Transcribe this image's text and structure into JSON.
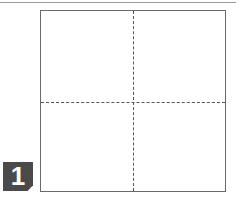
{
  "diagram": {
    "type": "folding-instruction-step",
    "step_number": "1",
    "paper": {
      "shape": "square",
      "fold_lines": [
        {
          "orientation": "vertical",
          "style": "dashed",
          "position": "center"
        },
        {
          "orientation": "horizontal",
          "style": "dashed",
          "position": "center"
        }
      ]
    },
    "colors": {
      "badge_bg": "#4a4a4a",
      "badge_text": "#ffffff",
      "outline": "#6a6a6a",
      "fold_line": "#555555"
    }
  }
}
